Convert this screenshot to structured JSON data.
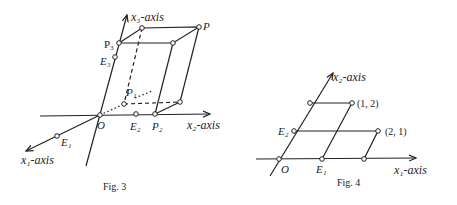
{
  "figures": [
    {
      "caption": "Fig. 3",
      "axes": {
        "x1": "x₁-axis",
        "x2": "x₂-axis",
        "x3": "x₃-axis"
      },
      "points": {
        "O": "O",
        "E1": "E₁",
        "E2": "E₂",
        "E3": "E₃",
        "P1": "P₁",
        "P2": "P₂",
        "P3": "P₃",
        "P": "P"
      }
    },
    {
      "caption": "Fig. 4",
      "axes": {
        "x1": "x₁-axis",
        "x2": "x₂-axis"
      },
      "points": {
        "O": "O",
        "E1": "E₁",
        "E2": "E₂",
        "p12": "(1, 2)",
        "p21": "(2, 1)"
      }
    }
  ],
  "colors": {
    "ink": "#222222",
    "background": "#ffffff"
  }
}
